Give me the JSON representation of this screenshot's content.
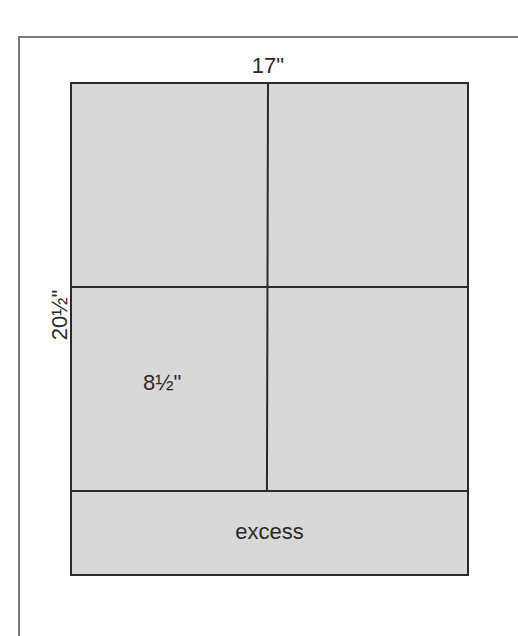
{
  "diagram": {
    "labels": {
      "width": "17\"",
      "height": "20½\"",
      "panel_width": "8½\"",
      "excess": "excess"
    },
    "layout": {
      "rows": 2,
      "columns": 2,
      "excess_strip": "bottom"
    },
    "colors": {
      "sheet_fill": "#d8d8d8",
      "line": "#2a2a2a",
      "frame": "#7a7a7a",
      "background": "#ffffff"
    }
  }
}
